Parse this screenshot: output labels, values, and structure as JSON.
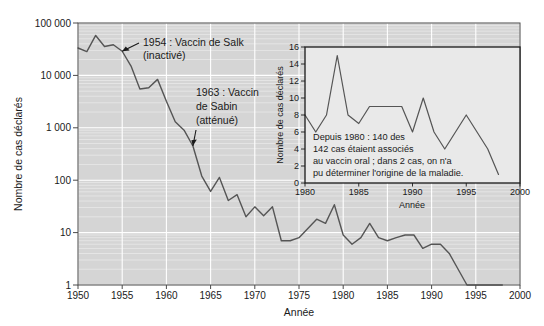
{
  "chart_data": {
    "type": "line",
    "title": "",
    "xlabel": "Année",
    "ylabel": "Nombre de cas déclarés",
    "yscale": "log",
    "xlim": [
      1950,
      2000
    ],
    "ylim": [
      1,
      100000
    ],
    "grid": true,
    "legend": "none",
    "x_ticks": [
      "1950",
      "1955",
      "1960",
      "1965",
      "1970",
      "1975",
      "1980",
      "1985",
      "1990",
      "1995",
      "2000"
    ],
    "x_tick_values": [
      1950,
      1955,
      1960,
      1965,
      1970,
      1975,
      1980,
      1985,
      1990,
      1995,
      2000
    ],
    "y_ticks": [
      "1",
      "10",
      "100",
      "1 000",
      "10 000",
      "100 000"
    ],
    "y_tick_values": [
      1,
      10,
      100,
      1000,
      10000,
      100000
    ],
    "series": [
      {
        "name": "Cas de poliomyélite déclarés",
        "color": "#555555",
        "x": [
          1950,
          1951,
          1952,
          1953,
          1954,
          1955,
          1956,
          1957,
          1958,
          1959,
          1960,
          1961,
          1962,
          1963,
          1964,
          1965,
          1966,
          1967,
          1968,
          1969,
          1970,
          1971,
          1972,
          1973,
          1974,
          1975,
          1976,
          1977,
          1978,
          1979,
          1980,
          1981,
          1982,
          1983,
          1984,
          1985,
          1986,
          1987,
          1988,
          1989,
          1990,
          1991,
          1992,
          1993,
          1994,
          1995,
          1996,
          1997,
          1998
        ],
        "values": [
          33300,
          28400,
          57900,
          35600,
          38500,
          28900,
          15100,
          5500,
          5800,
          8400,
          3200,
          1300,
          900,
          450,
          120,
          61,
          113,
          41,
          53,
          20,
          31,
          21,
          31,
          7,
          7,
          8,
          12,
          18,
          15,
          34,
          9,
          6,
          8,
          15,
          8,
          7,
          8,
          9,
          9,
          5,
          6,
          6,
          4,
          2,
          1,
          1,
          1,
          1,
          1
        ]
      }
    ],
    "annotations": [
      {
        "id": "salk",
        "lines": [
          "1954 : Vaccin de Salk",
          "(inactivé)"
        ],
        "target_x": 1955,
        "target_y": 28900
      },
      {
        "id": "sabin",
        "lines": [
          "1963 : Vaccin",
          "de Sabin",
          "(atténué)"
        ],
        "target_x": 1963,
        "target_y": 450
      }
    ]
  },
  "inset_chart_data": {
    "type": "line",
    "title": "",
    "xlabel": "Année",
    "ylabel": "Nombre de cas déclarés",
    "yscale": "linear",
    "xlim": [
      1980,
      2000
    ],
    "ylim": [
      0,
      16
    ],
    "grid": false,
    "legend": "none",
    "x_ticks": [
      "1980",
      "1985",
      "1990",
      "1995",
      "2000"
    ],
    "x_tick_values": [
      1980,
      1985,
      1990,
      1995,
      2000
    ],
    "y_ticks": [
      "0",
      "2",
      "4",
      "6",
      "8",
      "10",
      "12",
      "14",
      "16"
    ],
    "y_tick_values": [
      0,
      2,
      4,
      6,
      8,
      10,
      12,
      14,
      16
    ],
    "series": [
      {
        "name": "Cas déclarés depuis 1980",
        "color": "#555555",
        "x": [
          1980,
          1981,
          1982,
          1983,
          1984,
          1985,
          1986,
          1987,
          1988,
          1989,
          1990,
          1991,
          1992,
          1993,
          1994,
          1995,
          1996,
          1997,
          1998
        ],
        "values": [
          8,
          6,
          8,
          15,
          8,
          7,
          9,
          9,
          9,
          9,
          6,
          10,
          6,
          4,
          6,
          8,
          6,
          4,
          1
        ]
      }
    ],
    "note": {
      "lines": [
        "Depuis 1980 : 140 des",
        "142 cas étaient associés",
        "au vaccin oral ; dans 2 cas, on n'a",
        "pu déterminer l'origine de la maladie."
      ]
    }
  },
  "style": {
    "plot_background": "#d5d5d5",
    "gridline_color": "#f0f0f0",
    "major_gridline_color": "#ffffff",
    "line_color": "#555555",
    "axis_color": "#4a4a4a",
    "text_color": "#1a1a1a",
    "inset_background": "#e9e9e9",
    "page_background": "#ffffff"
  }
}
